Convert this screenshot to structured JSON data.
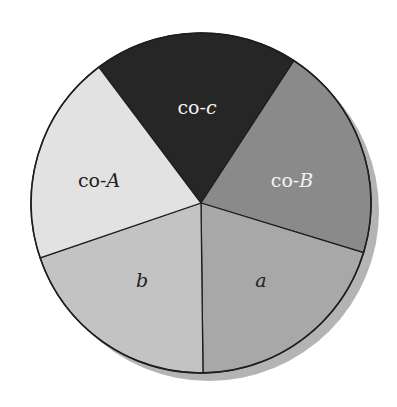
{
  "diagram": {
    "type": "pie-partition",
    "center": {
      "x": 201,
      "y": 203
    },
    "radius": 170,
    "shadow": {
      "dx": 8,
      "dy": 8,
      "color": "#b4b4b4"
    },
    "outline_color": "#1e1e1e",
    "wedges": [
      {
        "id": "co-c",
        "prefix": "co-",
        "symbol": "c",
        "fill": "#262626",
        "text_color": "#f0f0f0",
        "start": {
          "x": 98,
          "y": 66
        },
        "end": {
          "x": 293,
          "y": 62
        },
        "label_pos": {
          "x": 197,
          "y": 109
        }
      },
      {
        "id": "co-B",
        "prefix": "co-",
        "symbol": "B",
        "fill": "#8a8a8a",
        "text_color": "#f2f2f2",
        "start": {
          "x": 293,
          "y": 62
        },
        "end": {
          "x": 358,
          "y": 251
        },
        "label_pos": {
          "x": 292,
          "y": 182
        }
      },
      {
        "id": "a",
        "prefix": "",
        "symbol": "a",
        "fill": "#a8a8a8",
        "text_color": "#222222",
        "start": {
          "x": 358,
          "y": 251
        },
        "end": {
          "x": 203,
          "y": 373
        },
        "label_pos": {
          "x": 261,
          "y": 282
        }
      },
      {
        "id": "b",
        "prefix": "",
        "symbol": "b",
        "fill": "#c3c3c3",
        "text_color": "#222222",
        "start": {
          "x": 203,
          "y": 373
        },
        "end": {
          "x": 40,
          "y": 258
        },
        "label_pos": {
          "x": 142,
          "y": 282
        }
      },
      {
        "id": "co-A",
        "prefix": "co-",
        "symbol": "A",
        "fill": "#e2e2e2",
        "text_color": "#222222",
        "start": {
          "x": 40,
          "y": 258
        },
        "end": {
          "x": 98,
          "y": 66
        },
        "label_pos": {
          "x": 99,
          "y": 182
        }
      }
    ]
  }
}
